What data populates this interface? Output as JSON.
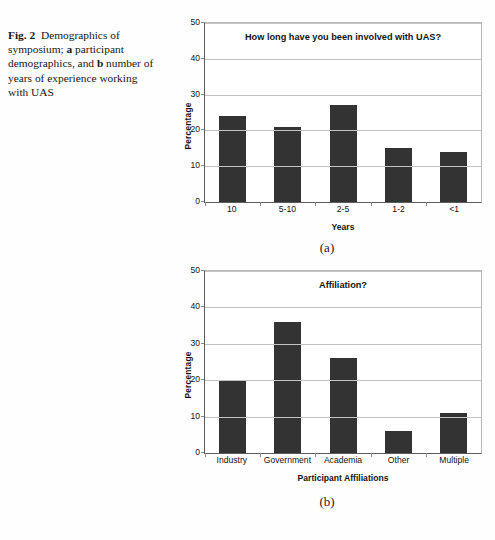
{
  "figure": {
    "caption_label": "Fig. 2",
    "caption_text_1": "Demographics of symposium; ",
    "caption_bold_a": "a",
    "caption_text_2": " participant demographics, and ",
    "caption_bold_b": "b",
    "caption_text_3": " number of years of experience working with UAS",
    "subcaption_a": "(a)",
    "subcaption_b": "(b)"
  },
  "colors": {
    "bar": "#333333",
    "grid": "#c3c3c3",
    "axis": "#5c5c5c",
    "frame": "#b9b9b9"
  },
  "chart_data": [
    {
      "type": "bar",
      "title": "How long have you been involved with UAS?",
      "xlabel": "Years",
      "ylabel": "Percentage",
      "categories": [
        "10",
        "5-10",
        "2-5",
        "1-2",
        "<1"
      ],
      "values": [
        24,
        21,
        27,
        15,
        14
      ],
      "ylim": [
        0,
        50
      ],
      "yticks": [
        50,
        40,
        30,
        20,
        10,
        0
      ],
      "grid": true,
      "legend": "none"
    },
    {
      "type": "bar",
      "title": "Affiliation?",
      "xlabel": "Participant Affiliations",
      "ylabel": "Percentage",
      "categories": [
        "Industry",
        "Government",
        "Academia",
        "Other",
        "Multiple"
      ],
      "values": [
        20,
        36,
        26,
        6,
        11
      ],
      "ylim": [
        0,
        50
      ],
      "yticks": [
        50,
        40,
        30,
        20,
        10,
        0
      ],
      "grid": true,
      "legend": "none"
    }
  ]
}
